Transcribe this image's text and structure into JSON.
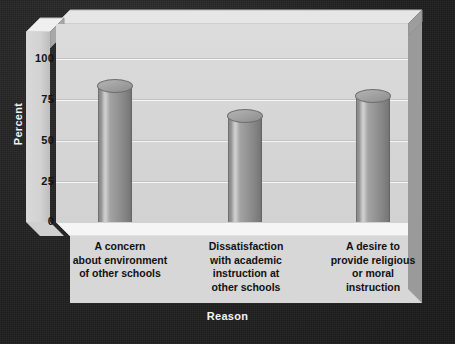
{
  "chart_data": {
    "type": "bar",
    "title": "",
    "xlabel": "Reason",
    "ylabel": "Percent",
    "categories": [
      "A concern\nabout environment\nof other schools",
      "Dissatisfaction\nwith academic\ninstruction at\nother schools",
      "A desire to\nprovide religious\nor moral\ninstruction"
    ],
    "values": [
      87,
      69,
      81
    ],
    "ylim": [
      0,
      100
    ],
    "yticks": [
      "0",
      "25",
      "50",
      "75",
      "100"
    ],
    "ytick_values": [
      0,
      25,
      50,
      75,
      100
    ],
    "grid": true,
    "legend": "none",
    "style": "3d-cylinder-bars"
  },
  "colors": {
    "backdrop": "#1f1f1f",
    "plot_area": "#d6d6d6",
    "gridline": "#c2c2c2",
    "bar_fill": "#969696",
    "bar_highlight": "#cfcfcf",
    "bar_shadow": "#727272",
    "floor": "#f3f3f3",
    "axis_text": "#131313",
    "axis_title_text": "#f2f2f2"
  }
}
